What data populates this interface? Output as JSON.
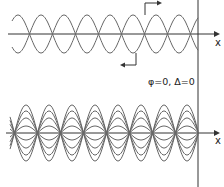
{
  "top_panel": {
    "axis_label": "x",
    "waves": [
      {
        "name": "wave-right-moving",
        "direction": "right"
      },
      {
        "name": "wave-left-moving",
        "direction": "left"
      }
    ]
  },
  "bottom_panel": {
    "axis_label": "x",
    "condition_label": "φ=0, Δ=0",
    "description": "standing wave snapshots"
  },
  "colors": {
    "line": "#555555",
    "axis": "#333333"
  }
}
